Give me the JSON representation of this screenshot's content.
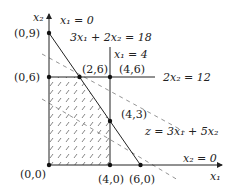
{
  "diagram": {
    "type": "linear-programming-feasible-region",
    "axes": {
      "x_label": "x1",
      "y_label": "x2"
    },
    "constraints": [
      {
        "id": "x1_nonneg",
        "label": "x₁ = 0"
      },
      {
        "id": "c1",
        "label": "3x₁ + 2x₂ = 18"
      },
      {
        "id": "c2",
        "label": "x₁ = 4"
      },
      {
        "id": "c3",
        "label": "2x₂ = 12"
      },
      {
        "id": "x2_nonneg",
        "label": "x₂ = 0"
      }
    ],
    "objective": {
      "label": "z = 3x₁ + 5x₂"
    },
    "points": [
      {
        "label": "(0,9)",
        "x": 0,
        "y": 9
      },
      {
        "label": "(0,6)",
        "x": 0,
        "y": 6
      },
      {
        "label": "(2,6)",
        "x": 2,
        "y": 6
      },
      {
        "label": "(4,6)",
        "x": 4,
        "y": 6
      },
      {
        "label": "(4,3)",
        "x": 4,
        "y": 3
      },
      {
        "label": "(0,0)",
        "x": 0,
        "y": 0
      },
      {
        "label": "(4,0)",
        "x": 4,
        "y": 0
      },
      {
        "label": "(6,0)",
        "x": 6,
        "y": 0
      }
    ],
    "feasible_region": [
      "(0,0)",
      "(4,0)",
      "(4,3)",
      "(2,6)",
      "(0,6)"
    ],
    "colors": {
      "line": "#222222",
      "dash": "#777777",
      "hatch": "#555555",
      "background": "#ffffff"
    }
  }
}
